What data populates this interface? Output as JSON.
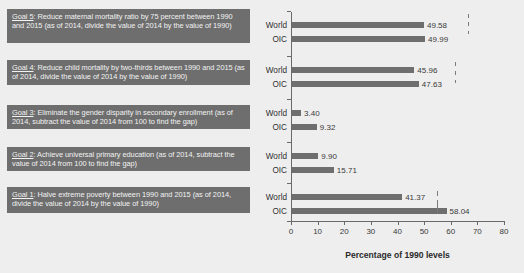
{
  "goals": [
    {
      "id": "goal-5",
      "num": "Goal 5",
      "text": ": Reduce maternal mortality ratio by 75 percent between 1990 and 2015 (as of 2014, divide the value of 2014 by the value of 1990)"
    },
    {
      "id": "goal-4",
      "num": "Goal 4",
      "text": ": Reduce child mortality by two-thirds  between 1990 and 2015 (as of 2014, divide the value of 2014 by the value of 1990)"
    },
    {
      "id": "goal-3",
      "num": "Goal 3",
      "text": ": Eliminate  the gender disparity in secondary enrollment (as of 2014, subtract the value of 2014  from 100 to find the gap)"
    },
    {
      "id": "goal-2",
      "num": "Goal 2",
      "text": ": Achieve universal primary education (as of 2014, subtract the value of 2014  from 100 to find the gap)"
    },
    {
      "id": "goal-1",
      "num": "Goal 1",
      "text": ": Halve extreme poverty between 1990 and 2015 (as of 2014, divide the value of 2014 by the value of 1990)"
    }
  ],
  "chart_data": {
    "type": "bar",
    "orientation": "horizontal",
    "title": "",
    "xlabel": "Percentage of 1990 levels",
    "ylabel": "",
    "xlim": [
      0,
      80
    ],
    "xticks": [
      "0",
      "10",
      "20",
      "30",
      "40",
      "50",
      "60",
      "70",
      "80"
    ],
    "grid": false,
    "legend": "none",
    "bar_color": "#6e6e6e",
    "groups": [
      {
        "goal": "Goal 5",
        "bars": [
          {
            "category": "World",
            "value": 49.58,
            "label": "49.58"
          },
          {
            "category": "OIC",
            "value": 49.99,
            "label": "49.99"
          }
        ]
      },
      {
        "goal": "Goal 4",
        "bars": [
          {
            "category": "World",
            "value": 45.96,
            "label": "45.96"
          },
          {
            "category": "OIC",
            "value": 47.63,
            "label": "47.63"
          }
        ]
      },
      {
        "goal": "Goal 3",
        "bars": [
          {
            "category": "World",
            "value": 3.4,
            "label": "3.40"
          },
          {
            "category": "OIC",
            "value": 9.32,
            "label": "9.32"
          }
        ]
      },
      {
        "goal": "Goal 2",
        "bars": [
          {
            "category": "World",
            "value": 9.9,
            "label": "9.90"
          },
          {
            "category": "OIC",
            "value": 15.71,
            "label": "15.71"
          }
        ]
      },
      {
        "goal": "Goal 1",
        "bars": [
          {
            "category": "World",
            "value": 41.37,
            "label": "41.37"
          },
          {
            "category": "OIC",
            "value": 58.04,
            "label": "58.04"
          }
        ]
      }
    ]
  }
}
